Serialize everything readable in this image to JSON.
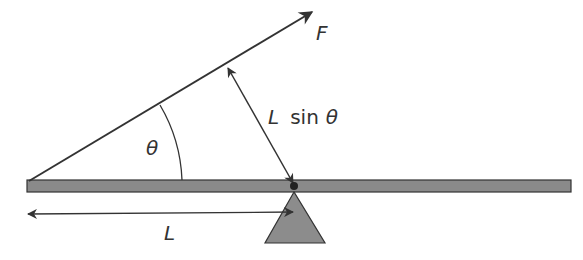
{
  "diagram": {
    "labels": {
      "force": "F",
      "angle": "θ",
      "moment_arm_L": "L",
      "moment_arm_sin": "sin",
      "moment_arm_theta": "θ",
      "length": "L"
    },
    "colors": {
      "line": "#333333",
      "beam_fill": "#8a8a8a",
      "fulcrum_fill": "#8c8c8c",
      "background": "#ffffff"
    },
    "elements": [
      "beam",
      "fulcrum",
      "pivot",
      "force-vector",
      "angle-arc",
      "moment-arm-arrow",
      "length-arrow"
    ]
  }
}
